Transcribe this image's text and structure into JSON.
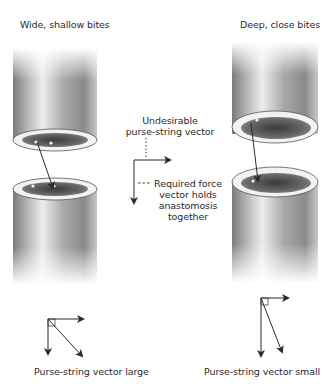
{
  "figure": {
    "left_panel": {
      "title": "Wide, shallow bites",
      "caption": "Purse-string vector large"
    },
    "right_panel": {
      "title": "Deep, close bites",
      "caption": "Purse-string vector small"
    },
    "center_annotation": {
      "undesirable_line1": "Undesirable",
      "undesirable_line2": "purse-string vector",
      "required_line1": "Required force",
      "required_line2": "vector holds",
      "required_line3": "anastomosis",
      "required_line4": "together"
    },
    "colors": {
      "ink": "#2b2b2b",
      "tube_dark": "#6e6e6e",
      "tube_light": "#e8e8e8",
      "background": "#ffffff"
    }
  }
}
